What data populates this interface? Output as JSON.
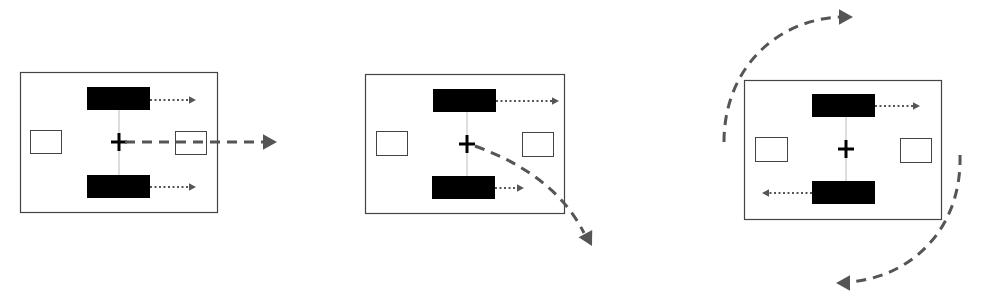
{
  "diagram": {
    "title": "",
    "colors": {
      "frame": "#444444",
      "block": "#000000",
      "arrow": "#555555",
      "axle": "#bbbbbb",
      "plus": "#000000"
    },
    "panels": [
      {
        "id": "translation",
        "frame": [
          20,
          72,
          197,
          140
        ],
        "blocks": [
          [
            87,
            87,
            63,
            23
          ],
          [
            87,
            175,
            63,
            23
          ]
        ],
        "small_boxes": [
          [
            30,
            130,
            31,
            23
          ],
          [
            175,
            131,
            31,
            23
          ]
        ],
        "center": [
          119,
          142
        ],
        "dotted_arrows": [
          [
            150,
            100,
            196,
            100
          ],
          [
            150,
            187,
            196,
            187
          ]
        ],
        "dashed_paths": [
          {
            "d": "M125,142 L266,142",
            "arrow_at": [
              277,
              142
            ],
            "arrow_angle": 0
          }
        ]
      },
      {
        "id": "curve",
        "frame": [
          365,
          74,
          199,
          139
        ],
        "blocks": [
          [
            433,
            89,
            63,
            23
          ],
          [
            432,
            176,
            63,
            23
          ]
        ],
        "small_boxes": [
          [
            376,
            131,
            31,
            24
          ],
          [
            522,
            132,
            31,
            24
          ]
        ],
        "center": [
          467,
          144
        ],
        "dotted_arrows": [
          [
            496,
            101,
            559,
            101
          ],
          [
            495,
            188,
            524,
            188
          ]
        ],
        "dashed_paths": [
          {
            "d": "M475,146 Q555,175 584,233",
            "arrow_at": [
              592,
              246
            ],
            "arrow_angle": 62
          }
        ]
      },
      {
        "id": "rotation",
        "frame": [
          744,
          80,
          197,
          139
        ],
        "blocks": [
          [
            812,
            94,
            63,
            23
          ],
          [
            812,
            181,
            63,
            23
          ]
        ],
        "small_boxes": [
          [
            755,
            137,
            32,
            24
          ],
          [
            900,
            138,
            31,
            24
          ]
        ],
        "center": [
          846,
          149
        ],
        "dotted_arrows": [
          [
            875,
            106,
            920,
            106
          ],
          [
            812,
            193,
            762,
            193
          ]
        ],
        "dashed_paths": [
          {
            "d": "M724,142 C724,70 775,20 840,17",
            "arrow_at": [
              853,
              17
            ],
            "arrow_angle": 0
          },
          {
            "d": "M960,155 C962,230 910,278 848,282",
            "arrow_at": [
              836,
              283
            ],
            "arrow_angle": 180
          }
        ]
      }
    ]
  }
}
